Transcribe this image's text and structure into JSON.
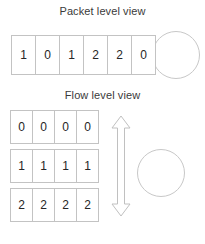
{
  "diagram": {
    "background_color": "#ffffff",
    "line_color": "#c3c3c3",
    "text_color": "#2b2b2b",
    "sections": {
      "packet": {
        "title": "Packet level view",
        "row": {
          "cells": [
            "1",
            "0",
            "1",
            "2",
            "2",
            "0"
          ]
        },
        "circle": {
          "label": ""
        }
      },
      "flow": {
        "title": "Flow level view",
        "rows": [
          {
            "cells": [
              "0",
              "0",
              "0",
              "0"
            ]
          },
          {
            "cells": [
              "1",
              "1",
              "1",
              "1"
            ]
          },
          {
            "cells": [
              "2",
              "2",
              "2",
              "2"
            ]
          }
        ],
        "circle": {
          "label": ""
        },
        "arrow": {
          "direction": "double-vertical",
          "label": ""
        }
      }
    }
  }
}
